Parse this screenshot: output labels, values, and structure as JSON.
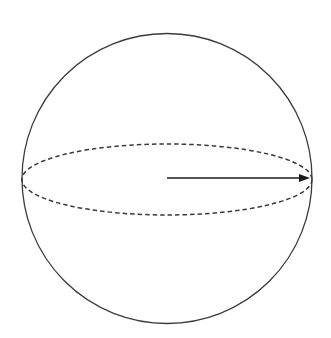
{
  "figure": {
    "name": "sphere-with-radius-arrow",
    "canvas": {
      "width": 331,
      "height": 338,
      "background_color": "#ffffff"
    },
    "style": {
      "stroke_color": "#3a3a3a",
      "arrow_color": "#1a1a1a",
      "outline_stroke_width": 1.3,
      "equator_stroke_width": 1.5,
      "arrow_stroke_width": 1.6,
      "equator_dash_pattern": "4.5 3"
    },
    "shapes": {
      "sphere_outline": {
        "label": "sphere-outline",
        "type": "circle",
        "center_x": 167,
        "center_y": 178.5,
        "radius": 145
      },
      "equator": {
        "label": "equator-ellipse",
        "type": "ellipse",
        "center_x": 167,
        "center_y": 179.5,
        "radius_x": 145,
        "radius_y": 35.5,
        "dashed": true
      },
      "radius_arrow": {
        "label": "radius-arrow",
        "type": "arrow",
        "start_x": 167,
        "start_y": 178,
        "end_x": 300,
        "end_y": 178,
        "tip_x": 310,
        "tip_y": 178,
        "head_length": 11,
        "head_width": 8
      }
    }
  }
}
